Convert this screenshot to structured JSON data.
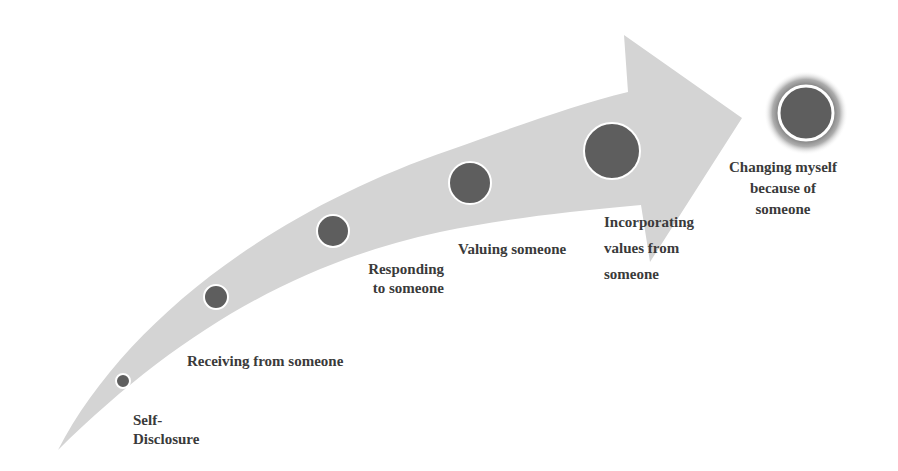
{
  "diagram": {
    "type": "progression-arrow",
    "colors": {
      "arrow_fill": "#d4d4d4",
      "node_fill": "#5e5e5e",
      "node_stroke": "#ffffff",
      "glow": "#6a6a6a",
      "text": "#3a3a3a"
    },
    "stages": [
      {
        "label_lines": [
          "Self-",
          "Disclosure"
        ],
        "cx": 123,
        "cy": 381,
        "r": 7
      },
      {
        "label_lines": [
          "Receiving from someone"
        ],
        "cx": 216,
        "cy": 297,
        "r": 12
      },
      {
        "label_lines": [
          "Responding",
          "to someone"
        ],
        "cx": 333,
        "cy": 231,
        "r": 16
      },
      {
        "label_lines": [
          "Valuing someone"
        ],
        "cx": 470,
        "cy": 183,
        "r": 21
      },
      {
        "label_lines": [
          "Incorporating",
          "values from",
          "someone"
        ],
        "cx": 612,
        "cy": 151,
        "r": 28
      },
      {
        "label_lines": [
          "Changing myself",
          "because of",
          "someone"
        ],
        "cx": 806,
        "cy": 113,
        "r": 27
      }
    ]
  }
}
